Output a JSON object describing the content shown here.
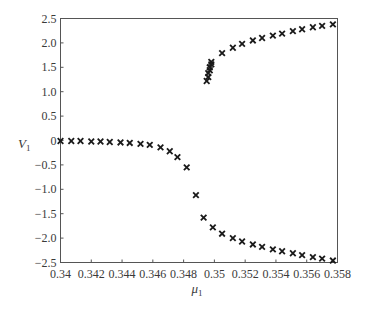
{
  "chart_data": {
    "type": "scatter",
    "title": "",
    "xlabel": "μ",
    "xlabel_sub": "1",
    "ylabel": "V",
    "ylabel_sub": "1",
    "xlim": [
      0.34,
      0.358
    ],
    "ylim": [
      -2.5,
      2.5
    ],
    "grid": false,
    "legend": null,
    "marker": "x",
    "x_ticks": [
      "0.34",
      "0.342",
      "0.344",
      "0.346",
      "0.348",
      "0.35",
      "0.352",
      "0.354",
      "0.356",
      "0.358"
    ],
    "y_ticks": [
      "2.5",
      "2.0",
      "1.5",
      "1.0",
      "0.5",
      "0",
      "-0.5",
      "-1.0",
      "-1.5",
      "-2.0",
      "-2.5"
    ],
    "series": [
      {
        "name": "approach branch",
        "points": [
          [
            0.34,
            -0.01
          ],
          [
            0.3407,
            -0.01
          ],
          [
            0.3413,
            -0.01
          ],
          [
            0.342,
            -0.02
          ],
          [
            0.3426,
            -0.02
          ],
          [
            0.3432,
            -0.03
          ],
          [
            0.3439,
            -0.04
          ],
          [
            0.3445,
            -0.05
          ],
          [
            0.3452,
            -0.07
          ],
          [
            0.3458,
            -0.09
          ],
          [
            0.3465,
            -0.14
          ],
          [
            0.3471,
            -0.22
          ],
          [
            0.3476,
            -0.34
          ],
          [
            0.3482,
            -0.55
          ],
          [
            0.3488,
            -1.12
          ]
        ]
      },
      {
        "name": "upper branch",
        "points": [
          [
            0.3495,
            1.22
          ],
          [
            0.3496,
            1.3
          ],
          [
            0.3496,
            1.38
          ],
          [
            0.3497,
            1.44
          ],
          [
            0.3497,
            1.5
          ],
          [
            0.3498,
            1.56
          ],
          [
            0.3498,
            1.61
          ],
          [
            0.3505,
            1.79
          ],
          [
            0.3512,
            1.9
          ],
          [
            0.3518,
            1.98
          ],
          [
            0.3525,
            2.05
          ],
          [
            0.3531,
            2.1
          ],
          [
            0.3538,
            2.15
          ],
          [
            0.3544,
            2.19
          ],
          [
            0.3551,
            2.24
          ],
          [
            0.3557,
            2.28
          ],
          [
            0.3564,
            2.32
          ],
          [
            0.357,
            2.35
          ],
          [
            0.3577,
            2.38
          ]
        ]
      },
      {
        "name": "lower branch",
        "points": [
          [
            0.3493,
            -1.58
          ],
          [
            0.3499,
            -1.78
          ],
          [
            0.3505,
            -1.91
          ],
          [
            0.3512,
            -2.0
          ],
          [
            0.3518,
            -2.07
          ],
          [
            0.3525,
            -2.13
          ],
          [
            0.3531,
            -2.18
          ],
          [
            0.3538,
            -2.23
          ],
          [
            0.3544,
            -2.27
          ],
          [
            0.3551,
            -2.31
          ],
          [
            0.3557,
            -2.35
          ],
          [
            0.3564,
            -2.39
          ],
          [
            0.357,
            -2.42
          ],
          [
            0.3577,
            -2.46
          ]
        ]
      }
    ]
  }
}
